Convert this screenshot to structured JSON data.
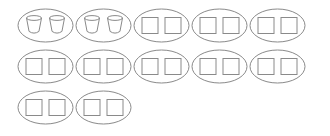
{
  "canvas": {
    "width": 330,
    "height": 136,
    "background": "#ffffff",
    "stroke_color": "#8a8a8a",
    "stroke_width": 1,
    "fill": "none"
  },
  "diagram": {
    "group_shape": "ellipse",
    "items_per_group": 2,
    "total_groups": 12,
    "total_items": 24,
    "layout": {
      "columns_per_row": [
        5,
        5,
        2
      ],
      "ellipse_rx": 27.5,
      "ellipse_ry": 16.5,
      "first_center_x": 45.5,
      "column_pitch_x": 58,
      "row_center_y": [
        25.5,
        66.5,
        107.5
      ],
      "item_offset_x": 11.5,
      "square_size": 16,
      "cup_width": 15,
      "cup_height": 15
    },
    "groups": [
      {
        "id": "group-1",
        "row": 1,
        "column": 1,
        "item_type": "cup",
        "item_count": 2
      },
      {
        "id": "group-2",
        "row": 1,
        "column": 2,
        "item_type": "cup",
        "item_count": 2
      },
      {
        "id": "group-3",
        "row": 1,
        "column": 3,
        "item_type": "square",
        "item_count": 2
      },
      {
        "id": "group-4",
        "row": 1,
        "column": 4,
        "item_type": "square",
        "item_count": 2
      },
      {
        "id": "group-5",
        "row": 1,
        "column": 5,
        "item_type": "square",
        "item_count": 2
      },
      {
        "id": "group-6",
        "row": 2,
        "column": 1,
        "item_type": "square",
        "item_count": 2
      },
      {
        "id": "group-7",
        "row": 2,
        "column": 2,
        "item_type": "square",
        "item_count": 2
      },
      {
        "id": "group-8",
        "row": 2,
        "column": 3,
        "item_type": "square",
        "item_count": 2
      },
      {
        "id": "group-9",
        "row": 2,
        "column": 4,
        "item_type": "square",
        "item_count": 2
      },
      {
        "id": "group-10",
        "row": 2,
        "column": 5,
        "item_type": "square",
        "item_count": 2
      },
      {
        "id": "group-11",
        "row": 3,
        "column": 1,
        "item_type": "square",
        "item_count": 2
      },
      {
        "id": "group-12",
        "row": 3,
        "column": 2,
        "item_type": "square",
        "item_count": 2
      }
    ]
  }
}
